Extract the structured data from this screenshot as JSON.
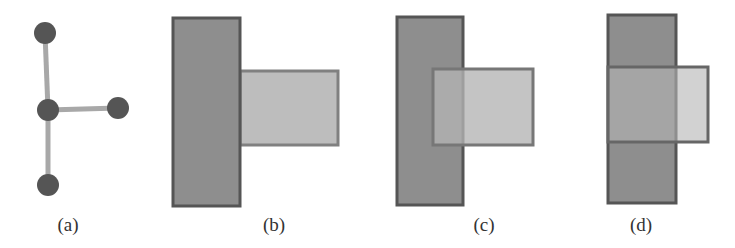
{
  "figure": {
    "panels": [
      {
        "id": "a",
        "label": "(a)",
        "kind": "graph",
        "nodes": [
          {
            "name": "top",
            "x": 45,
            "y": 33
          },
          {
            "name": "center",
            "x": 48,
            "y": 110
          },
          {
            "name": "right",
            "x": 118,
            "y": 108
          },
          {
            "name": "bottom",
            "x": 48,
            "y": 185
          }
        ],
        "edges": [
          [
            "top",
            "center"
          ],
          [
            "center",
            "right"
          ],
          [
            "center",
            "bottom"
          ]
        ]
      },
      {
        "id": "b",
        "label": "(b)",
        "kind": "rectangles",
        "tall": {
          "x": 173,
          "y": 18,
          "w": 67,
          "h": 188
        },
        "small": {
          "x": 240,
          "y": 71,
          "w": 98,
          "h": 74
        },
        "small_on_top": false
      },
      {
        "id": "c",
        "label": "(c)",
        "kind": "rectangles",
        "tall": {
          "x": 397,
          "y": 17,
          "w": 66,
          "h": 188
        },
        "small": {
          "x": 433,
          "y": 69,
          "w": 100,
          "h": 76
        },
        "small_on_top": true
      },
      {
        "id": "d",
        "label": "(d)",
        "kind": "rectangles",
        "tall": {
          "x": 608,
          "y": 15,
          "w": 68,
          "h": 188
        },
        "small": {
          "x": 608,
          "y": 67,
          "w": 100,
          "h": 75
        },
        "small_on_top": true
      }
    ],
    "colors": {
      "node_fill": "#555555",
      "edge": "#a8a8a8",
      "tall_fill": "#8e8e8e",
      "tall_stroke": "#5a5a5a",
      "small_fill": "#b8b8b8",
      "small_stroke": "#7a7a7a"
    }
  }
}
